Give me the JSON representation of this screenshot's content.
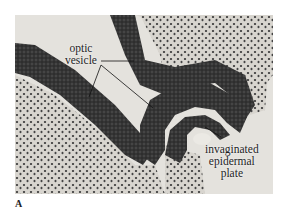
{
  "figure": {
    "panel_letter": "A",
    "labels": [
      {
        "id": "optic-vesicle",
        "line1": "optic",
        "line2": "vesicle"
      },
      {
        "id": "invaginated-epidermal-plate",
        "line1": "invaginated",
        "line2": "epidermal",
        "line3": "plate"
      }
    ],
    "colors": {
      "background": "#e4e2dd",
      "tissue_dark": "#2e2e2e",
      "tissue_mid": "#4a4a4a",
      "mesenchyme": "#cfccc6",
      "label_text": "#1e1e1e"
    }
  }
}
